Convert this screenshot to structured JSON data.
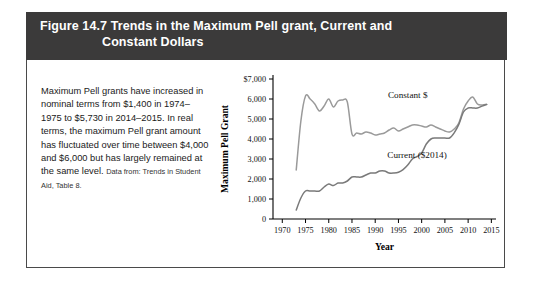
{
  "figure": {
    "header_line_1": "Figure 14.7  Trends in the Maximum Pell grant, Current and",
    "header_line_2": "Constant Dollars",
    "header_bg": "#3b3a3a",
    "header_text_color": "#ffffff"
  },
  "caption": {
    "body": "Maximum Pell grants have increased in nominal terms from $1,400 in 1974–1975 to $5,730 in 2014–2015. In real terms, the maximum Pell grant amount has fluctuated over time between $4,000 and $6,000 but has largely remained at the same level.",
    "source": "Data from: Trends in Student Aid, Table 8."
  },
  "chart_data": {
    "type": "line",
    "title": "",
    "xlabel": "Year",
    "ylabel": "Maximum Pell Grant",
    "xlim": [
      1968,
      2016
    ],
    "ylim": [
      0,
      7000
    ],
    "xticks": [
      1970,
      1975,
      1980,
      1985,
      1990,
      1995,
      2000,
      2005,
      2010,
      2015
    ],
    "xtick_labels": [
      "1970",
      "1975",
      "1980",
      "1985",
      "1990",
      "1995",
      "2000",
      "2005",
      "2010",
      "2015"
    ],
    "yticks": [
      0,
      1000,
      2000,
      3000,
      4000,
      5000,
      6000,
      7000
    ],
    "ytick_labels": [
      "0",
      "1,000",
      "2,000",
      "3,000",
      "4,000",
      "5,000",
      "6,000",
      "$7,000"
    ],
    "grid": false,
    "legend_position": "inline-annotation",
    "series": [
      {
        "name": "Constant $",
        "color": "#9a9a9a",
        "label_x": 1997,
        "label_y": 6050,
        "x": [
          1973,
          1974,
          1975,
          1976,
          1977,
          1978,
          1979,
          1980,
          1981,
          1982,
          1983,
          1984,
          1985,
          1986,
          1987,
          1988,
          1989,
          1990,
          1991,
          1992,
          1993,
          1994,
          1995,
          1996,
          1997,
          1998,
          1999,
          2000,
          2001,
          2002,
          2003,
          2004,
          2005,
          2006,
          2007,
          2008,
          2009,
          2010,
          2011,
          2012,
          2013,
          2014
        ],
        "values": [
          2450,
          4900,
          6150,
          6000,
          5750,
          5400,
          5650,
          6000,
          5600,
          5900,
          5950,
          5850,
          4250,
          4300,
          4250,
          4350,
          4300,
          4200,
          4250,
          4300,
          4450,
          4550,
          4400,
          4500,
          4600,
          4700,
          4700,
          4650,
          4600,
          4700,
          4600,
          4500,
          4400,
          4350,
          4500,
          4800,
          5500,
          5900,
          6100,
          5750,
          5700,
          5730
        ]
      },
      {
        "name": "Current ($2014)",
        "color": "#7a7a7a",
        "label_x": 1999,
        "label_y": 3050,
        "x": [
          1973,
          1974,
          1975,
          1976,
          1977,
          1978,
          1979,
          1980,
          1981,
          1982,
          1983,
          1984,
          1985,
          1986,
          1987,
          1988,
          1989,
          1990,
          1991,
          1992,
          1993,
          1994,
          1995,
          1996,
          1997,
          1998,
          1999,
          2000,
          2001,
          2002,
          2003,
          2004,
          2005,
          2006,
          2007,
          2008,
          2009,
          2010,
          2011,
          2012,
          2013,
          2014
        ],
        "values": [
          450,
          1050,
          1400,
          1400,
          1400,
          1400,
          1600,
          1750,
          1670,
          1800,
          1800,
          1900,
          2100,
          2100,
          2100,
          2200,
          2300,
          2300,
          2400,
          2400,
          2300,
          2300,
          2340,
          2470,
          2700,
          3000,
          3125,
          3300,
          3750,
          4000,
          4050,
          4050,
          4050,
          4050,
          4310,
          4731,
          5350,
          5550,
          5550,
          5550,
          5645,
          5730
        ]
      }
    ]
  }
}
